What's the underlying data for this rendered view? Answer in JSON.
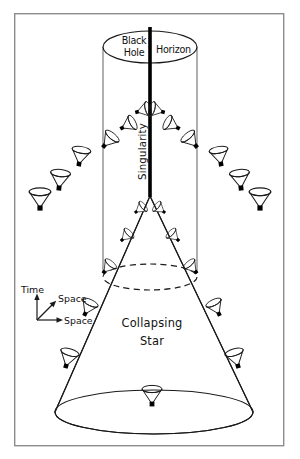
{
  "figure": {
    "background_color": "#ffffff",
    "ink_color": "#1a1a1a",
    "frame_color": "#8c8c8c"
  },
  "labels": {
    "black_hole_line1": "Black",
    "black_hole_line2": "Hole",
    "horizon": "Horizon",
    "singularity": "Singularity",
    "collapsing_star_line1": "Collapsing",
    "collapsing_star_line2": "Star",
    "axis_time": "Time",
    "axis_space_diagonal": "Space",
    "axis_space_horizontal": "Space"
  },
  "geometry": {
    "frame": {
      "x": 14,
      "y": 13,
      "width": 270,
      "height": 433
    },
    "horizon_cylinder": {
      "center_x": 150,
      "top_ellipse_cy": 47,
      "rx": 47,
      "ry": 16,
      "bottom_y": 272
    },
    "singularity_line": {
      "x": 150,
      "y_top": 27,
      "y_bottom": 196
    },
    "dashed_ellipse": {
      "cx": 150,
      "cy": 277,
      "rx": 47,
      "ry": 13
    },
    "star_base_ellipse": {
      "cx": 154,
      "cy": 412,
      "rx": 99,
      "ry": 22
    },
    "star_apex": {
      "x": 150,
      "y": 196
    },
    "axes_origin": {
      "x": 37,
      "y": 320
    }
  },
  "light_cones": [
    {
      "id": "cone-far-left-lower",
      "x": 40,
      "y": 208,
      "tilt_deg": 0,
      "scale": 1.08,
      "region": "exterior"
    },
    {
      "id": "cone-left-outer-2",
      "x": 59,
      "y": 188,
      "tilt_deg": 6,
      "scale": 1.0,
      "region": "exterior"
    },
    {
      "id": "cone-left-outer-3",
      "x": 79,
      "y": 164,
      "tilt_deg": 10,
      "scale": 0.95,
      "region": "exterior"
    },
    {
      "id": "cone-left-horizon",
      "x": 104,
      "y": 146,
      "tilt_deg": 40,
      "scale": 0.86,
      "region": "horizon"
    },
    {
      "id": "cone-left-inner-1",
      "x": 122,
      "y": 128,
      "tilt_deg": 62,
      "scale": 0.8,
      "region": "interior"
    },
    {
      "id": "cone-left-inner-2",
      "x": 137,
      "y": 112,
      "tilt_deg": 74,
      "scale": 0.76,
      "region": "interior"
    },
    {
      "id": "cone-right-inner-2",
      "x": 163,
      "y": 112,
      "tilt_deg": -74,
      "scale": 0.76,
      "region": "interior"
    },
    {
      "id": "cone-right-inner-1",
      "x": 178,
      "y": 128,
      "tilt_deg": -62,
      "scale": 0.8,
      "region": "interior"
    },
    {
      "id": "cone-right-horizon",
      "x": 196,
      "y": 146,
      "tilt_deg": -40,
      "scale": 0.86,
      "region": "horizon"
    },
    {
      "id": "cone-right-outer-3",
      "x": 221,
      "y": 164,
      "tilt_deg": -10,
      "scale": 0.95,
      "region": "exterior"
    },
    {
      "id": "cone-right-outer-2",
      "x": 241,
      "y": 188,
      "tilt_deg": -6,
      "scale": 1.0,
      "region": "exterior"
    },
    {
      "id": "cone-far-right-lower",
      "x": 260,
      "y": 208,
      "tilt_deg": 0,
      "scale": 1.08,
      "region": "exterior"
    },
    {
      "id": "cone-star-apex-left",
      "x": 136,
      "y": 212,
      "tilt_deg": 52,
      "scale": 0.62,
      "region": "star-surface"
    },
    {
      "id": "cone-star-apex-right",
      "x": 164,
      "y": 212,
      "tilt_deg": -52,
      "scale": 0.62,
      "region": "star-surface"
    },
    {
      "id": "cone-star-left-2",
      "x": 122,
      "y": 240,
      "tilt_deg": 46,
      "scale": 0.66,
      "region": "star-surface"
    },
    {
      "id": "cone-star-right-2",
      "x": 178,
      "y": 240,
      "tilt_deg": -46,
      "scale": 0.66,
      "region": "star-surface"
    },
    {
      "id": "cone-star-left-3",
      "x": 104,
      "y": 272,
      "tilt_deg": 40,
      "scale": 0.72,
      "region": "star-surface"
    },
    {
      "id": "cone-star-right-3",
      "x": 196,
      "y": 272,
      "tilt_deg": -40,
      "scale": 0.72,
      "region": "star-surface"
    },
    {
      "id": "cone-star-left-4",
      "x": 85,
      "y": 314,
      "tilt_deg": 26,
      "scale": 0.84,
      "region": "star-surface"
    },
    {
      "id": "cone-star-right-4",
      "x": 219,
      "y": 314,
      "tilt_deg": -26,
      "scale": 0.84,
      "region": "star-surface"
    },
    {
      "id": "cone-star-left-5",
      "x": 66,
      "y": 366,
      "tilt_deg": 16,
      "scale": 0.95,
      "region": "star-surface"
    },
    {
      "id": "cone-star-right-5",
      "x": 238,
      "y": 366,
      "tilt_deg": -16,
      "scale": 0.95,
      "region": "star-surface"
    },
    {
      "id": "cone-star-center-bottom",
      "x": 152,
      "y": 404,
      "tilt_deg": 0,
      "scale": 1.0,
      "region": "star-interior"
    }
  ]
}
